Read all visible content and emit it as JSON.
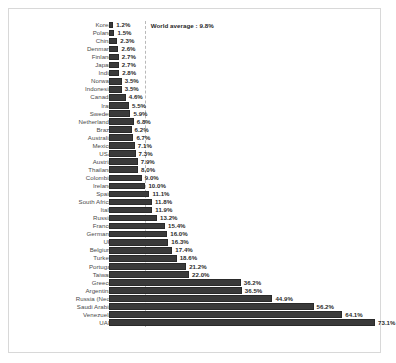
{
  "chart_data": {
    "type": "bar",
    "orientation": "horizontal",
    "title": "",
    "xlabel": "",
    "ylabel": "",
    "grid": false,
    "legend": null,
    "value_suffix": "%",
    "xlim": [
      0,
      73.1
    ],
    "sort": "ascending",
    "categories": [
      "Korea",
      "Poland",
      "China",
      "Denmark",
      "Finland",
      "Japan",
      "India",
      "Norway",
      "Indonesia",
      "Canada",
      "Iran",
      "Sweden",
      "Netherlands",
      "Brazil",
      "Australia",
      "Mexico",
      "USA",
      "Austria",
      "Thailand",
      "Colombia",
      "Ireland",
      "Spain",
      "South Africa",
      "Italy",
      "Russia",
      "France",
      "Germany",
      "UK",
      "Belgium",
      "Turkey",
      "Portugal",
      "Taiwan",
      "Greece",
      "Argentina",
      "Russia (Neo)",
      "Saudi Arabia",
      "Venezuela",
      "UAE"
    ],
    "values": [
      1.2,
      1.5,
      2.3,
      2.6,
      2.7,
      2.7,
      2.8,
      3.5,
      3.5,
      4.6,
      5.5,
      5.9,
      6.8,
      6.2,
      6.7,
      7.1,
      7.3,
      7.9,
      8.0,
      9.0,
      10.0,
      11.1,
      11.8,
      11.9,
      13.2,
      15.4,
      16.0,
      16.3,
      17.4,
      18.6,
      21.2,
      22.0,
      36.2,
      36.5,
      44.9,
      56.2,
      64.1,
      73.1
    ],
    "value_labels": [
      "1.2%",
      "1.5%",
      "2.3%",
      "2.6%",
      "2.7%",
      "2.7%",
      "2.8%",
      "3.5%",
      "3.5%",
      "4.6%",
      "5.5%",
      "5.9%",
      "6.8%",
      "6.2%",
      "6.7%",
      "7.1%",
      "7.3%",
      "7.9%",
      "8.0%",
      "9.0%",
      "10.0%",
      "11.1%",
      "11.8%",
      "11.9%",
      "13.2%",
      "15.4%",
      "16.0%",
      "16.3%",
      "17.4%",
      "18.6%",
      "21.2%",
      "22.0%",
      "36.2%",
      "36.5%",
      "44.9%",
      "56.2%",
      "64.1%",
      "73.1%"
    ],
    "annotations": [
      {
        "name": "world-average",
        "label": "World average : 9.8%",
        "value": 9.8,
        "style": "dashed-vertical-line"
      }
    ],
    "colors": {
      "bar_fill": "#3a3a3a",
      "bar_edge": "#2a2a2a",
      "category_label": "#4a4a4a",
      "value_label": "#2b2b2b",
      "reference_line": "#b9b9b9",
      "frame": "#d8d8d8",
      "background": "#ffffff"
    }
  }
}
